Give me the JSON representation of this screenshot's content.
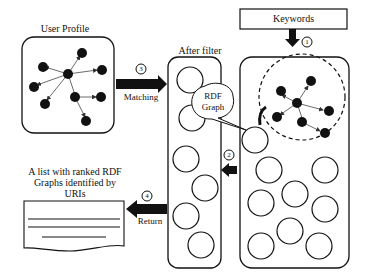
{
  "diagram": {
    "user_profile": {
      "label": "User Profile"
    },
    "after_filter": {
      "label": "After filter"
    },
    "keywords": {
      "label": "Keywords"
    },
    "rdf_graph_callout": {
      "line1": "RDF",
      "line2": "Graph"
    },
    "result_list": {
      "line1": "A list with ranked RDF",
      "line2": "Graphs  identified by",
      "line3": "URIs"
    },
    "steps": [
      {
        "number": "1",
        "label": ""
      },
      {
        "number": "2",
        "label": ""
      },
      {
        "number": "3",
        "label": "Matching"
      },
      {
        "number": "4",
        "label": "Return"
      }
    ],
    "colors": {
      "stroke": "#111111",
      "node": "#111111",
      "background": "#ffffff"
    }
  }
}
